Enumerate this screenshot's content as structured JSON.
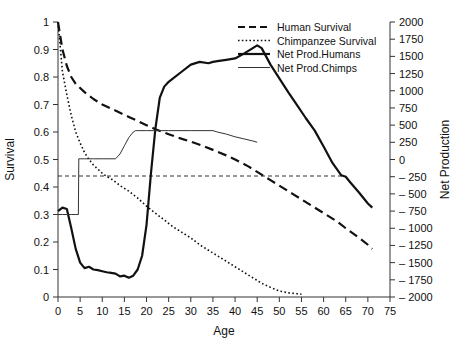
{
  "chart_data": {
    "type": "line",
    "title": "",
    "xlabel": "Age",
    "ylabel": "Survival",
    "y2label": "Net Production",
    "xlim": [
      0,
      75
    ],
    "ylim": [
      0,
      1
    ],
    "y2lim": [
      -2000,
      2000
    ],
    "grid": false,
    "legend_position": "top-right",
    "xticks": [
      0,
      5,
      10,
      15,
      20,
      25,
      30,
      35,
      40,
      45,
      50,
      55,
      60,
      65,
      70,
      75
    ],
    "xtick_labels": [
      "0",
      "5",
      "10",
      "15",
      "20",
      "25",
      "30",
      "35",
      "40",
      "45",
      "50",
      "55",
      "60",
      "65",
      "70",
      "75"
    ],
    "yticks": [
      0,
      0.1,
      0.2,
      0.3,
      0.4,
      0.5,
      0.6,
      0.7,
      0.8,
      0.9,
      1
    ],
    "ytick_labels": [
      "0",
      "0.1",
      "0.2",
      "0.3",
      "0.4",
      "0.5",
      "0.6",
      "0.7",
      "0.8",
      "0.9",
      "1"
    ],
    "y2ticks": [
      -2000,
      -1750,
      -1500,
      -1250,
      -1000,
      -750,
      -500,
      -250,
      0,
      250,
      500,
      750,
      1000,
      1250,
      1500,
      1750,
      2000
    ],
    "y2tick_labels": [
      "– 2000",
      "– 1750",
      "– 1500",
      "– 1250",
      "– 1000",
      "– 750",
      "– 500",
      "– 250",
      "0",
      "250",
      "500",
      "750",
      "1000",
      "1250",
      "1500",
      "1750",
      "2000"
    ],
    "reference_line": {
      "axis": "left",
      "value": 0.44,
      "x_start": 0,
      "x_end": 65,
      "style": "dashed",
      "color": "#333333"
    },
    "series": [
      {
        "name": "Human Survival",
        "axis": "left",
        "style": "dashed",
        "color": "#111111",
        "width": 2.2,
        "x": [
          0,
          1,
          2,
          3,
          4,
          5,
          6,
          8,
          10,
          12,
          14,
          16,
          18,
          20,
          22,
          25,
          28,
          30,
          33,
          35,
          38,
          40,
          43,
          45,
          48,
          50,
          53,
          55,
          58,
          60,
          63,
          65,
          68,
          70,
          71
        ],
        "y": [
          1.0,
          0.9,
          0.84,
          0.8,
          0.775,
          0.76,
          0.745,
          0.72,
          0.7,
          0.685,
          0.67,
          0.655,
          0.64,
          0.625,
          0.61,
          0.592,
          0.575,
          0.565,
          0.548,
          0.535,
          0.515,
          0.5,
          0.475,
          0.455,
          0.425,
          0.405,
          0.375,
          0.355,
          0.325,
          0.305,
          0.275,
          0.25,
          0.215,
          0.19,
          0.175
        ]
      },
      {
        "name": "Chimpanzee Survival",
        "axis": "left",
        "style": "dotted",
        "color": "#111111",
        "width": 1.6,
        "x": [
          0,
          1,
          2,
          3,
          4,
          5,
          6,
          7,
          8,
          9,
          10,
          11,
          12,
          13,
          14,
          15,
          16,
          17,
          18,
          19,
          20,
          22,
          24,
          26,
          28,
          30,
          32,
          34,
          36,
          38,
          40,
          42,
          44,
          46,
          48,
          50,
          52,
          54,
          55
        ],
        "y": [
          1.0,
          0.82,
          0.735,
          0.66,
          0.6,
          0.56,
          0.525,
          0.5,
          0.48,
          0.465,
          0.45,
          0.438,
          0.43,
          0.418,
          0.405,
          0.395,
          0.385,
          0.372,
          0.36,
          0.345,
          0.33,
          0.305,
          0.28,
          0.255,
          0.235,
          0.215,
          0.19,
          0.17,
          0.15,
          0.13,
          0.11,
          0.09,
          0.07,
          0.05,
          0.035,
          0.022,
          0.015,
          0.012,
          0.01
        ]
      },
      {
        "name": "Net Prod.Humans",
        "axis": "right",
        "style": "solid",
        "color": "#111111",
        "width": 2.2,
        "x": [
          0,
          1,
          2,
          3,
          4,
          5,
          6,
          7,
          8,
          9,
          10,
          11,
          12,
          13,
          14,
          15,
          16,
          17,
          18,
          19,
          20,
          21,
          22,
          23,
          24,
          25,
          26,
          28,
          30,
          32,
          34,
          35,
          36,
          38,
          40,
          42,
          44,
          45,
          46,
          47,
          48,
          50,
          52,
          54,
          56,
          58,
          60,
          62,
          64,
          65,
          66,
          68,
          70,
          71
        ],
        "y": [
          -750,
          -700,
          -720,
          -1000,
          -1300,
          -1500,
          -1580,
          -1560,
          -1600,
          -1610,
          -1625,
          -1640,
          -1650,
          -1660,
          -1700,
          -1690,
          -1720,
          -1690,
          -1600,
          -1400,
          -950,
          -200,
          450,
          900,
          1060,
          1130,
          1180,
          1280,
          1380,
          1420,
          1400,
          1420,
          1430,
          1450,
          1470,
          1540,
          1620,
          1660,
          1620,
          1500,
          1380,
          1180,
          980,
          790,
          600,
          420,
          190,
          -50,
          -230,
          -250,
          -330,
          -480,
          -640,
          -700
        ]
      },
      {
        "name": "Net Prod.Chimps",
        "axis": "right",
        "style": "solid",
        "color": "#333333",
        "width": 1.0,
        "x": [
          0,
          1,
          2,
          3,
          4,
          4.6,
          4.7,
          5,
          6,
          8,
          10,
          12,
          13,
          14,
          15,
          16,
          17,
          17.5,
          18,
          20,
          25,
          30,
          35,
          36,
          38,
          40,
          42,
          44,
          45
        ],
        "y": [
          -800,
          -800,
          -800,
          -800,
          -800,
          -800,
          10,
          10,
          10,
          10,
          10,
          10,
          10,
          80,
          200,
          320,
          400,
          420,
          420,
          420,
          420,
          420,
          420,
          400,
          370,
          330,
          300,
          270,
          250
        ]
      }
    ]
  },
  "legend": {
    "items": [
      {
        "label": "Human Survival",
        "style": "dashed",
        "color": "#111111"
      },
      {
        "label": "Chimpanzee Survival",
        "style": "dotted",
        "color": "#111111"
      },
      {
        "label": "Net Prod.Humans",
        "style": "solid",
        "color": "#111111"
      },
      {
        "label": "Net Prod.Chimps",
        "style": "thin-solid",
        "color": "#333333"
      }
    ]
  }
}
